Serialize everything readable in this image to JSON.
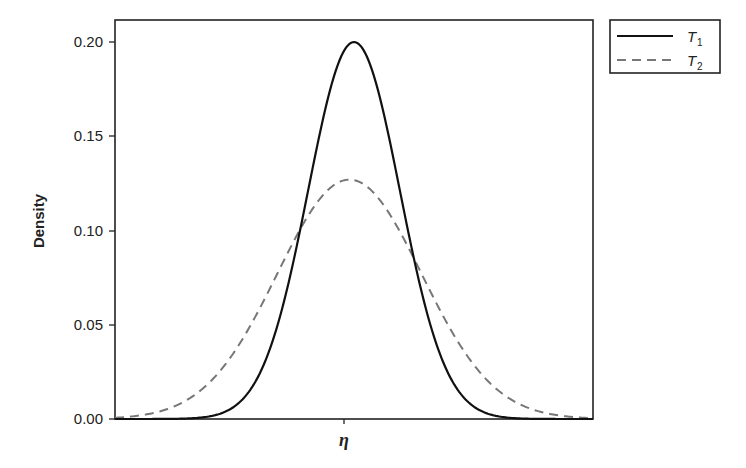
{
  "chart_data": {
    "type": "line",
    "title": "",
    "xlabel": "η",
    "ylabel": "Density",
    "xlim": [
      -10.4,
      10.4
    ],
    "ylim": [
      0,
      0.21
    ],
    "yticks": [
      0.0,
      0.05,
      0.1,
      0.15,
      0.2
    ],
    "ytick_labels": [
      "0.00",
      "0.05",
      "0.10",
      "0.15",
      "0.20"
    ],
    "xticks": [
      0
    ],
    "xtick_labels": [
      ""
    ],
    "grid": false,
    "legend_position": "outside-top-right",
    "series": [
      {
        "name": "T1",
        "label_main": "T",
        "label_sub": "1",
        "style": "solid",
        "color": "#111111",
        "distribution": "normal",
        "mean": 0,
        "sd": 1.995,
        "peak": 0.2
      },
      {
        "name": "T2",
        "label_main": "T",
        "label_sub": "2",
        "style": "dashed",
        "color": "#777777",
        "distribution": "normal",
        "mean": -0.2,
        "sd": 3.14,
        "peak": 0.127
      }
    ]
  },
  "axis": {
    "ylabel": "Density",
    "xlabel": "η",
    "yticks": [
      "0.20",
      "0.15",
      "0.10",
      "0.05",
      "0.00"
    ]
  },
  "legend": {
    "items": [
      {
        "main": "T",
        "sub": "1"
      },
      {
        "main": "T",
        "sub": "2"
      }
    ]
  }
}
